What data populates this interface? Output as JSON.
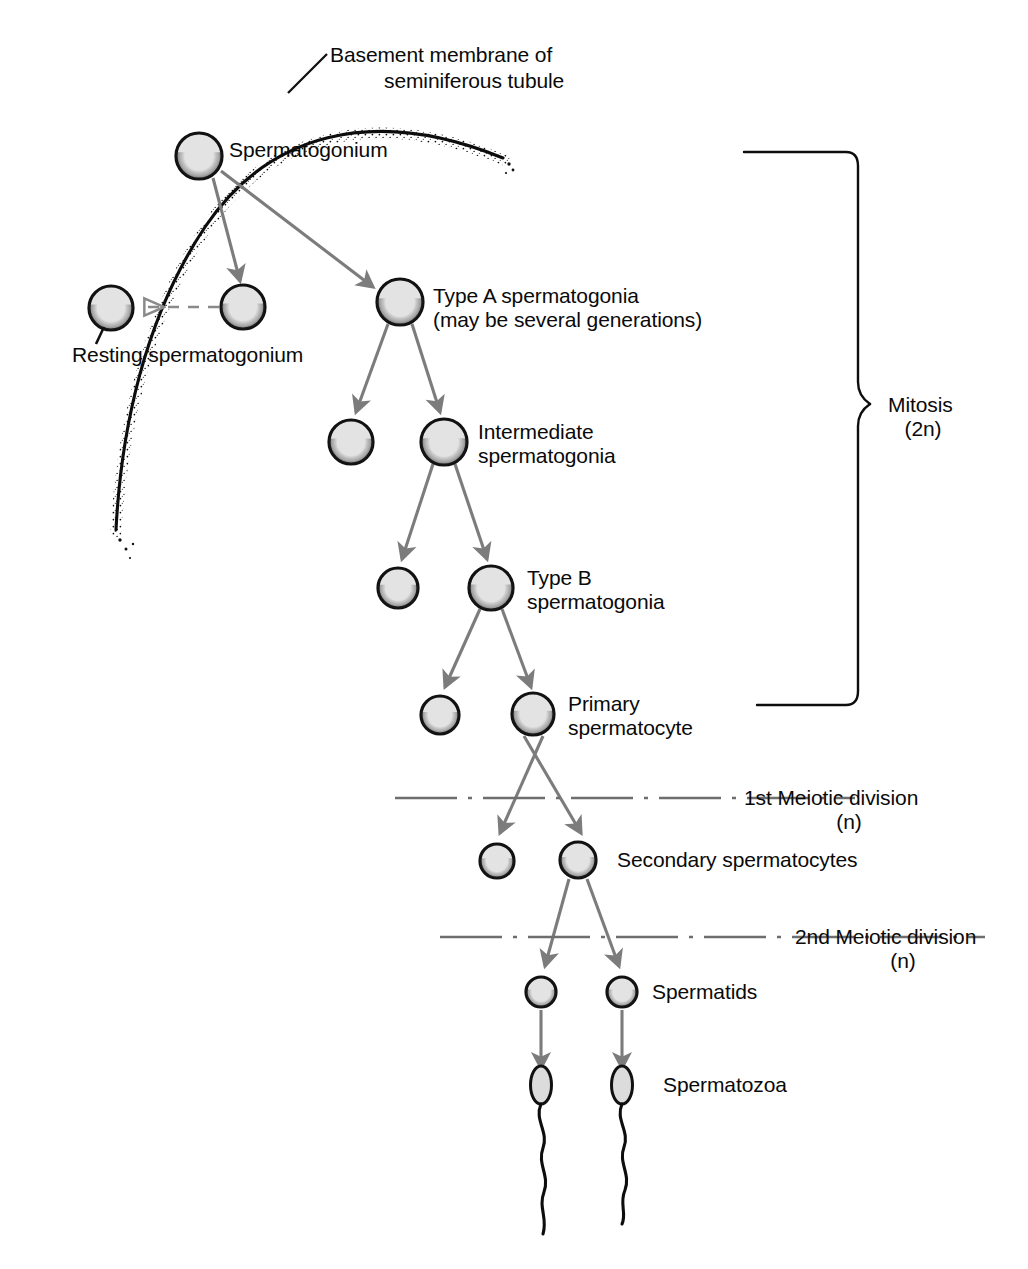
{
  "figure": {
    "background_color": "#ffffff",
    "ink_color": "#0a0a0a",
    "arrow_color": "#7c7c7c",
    "cell_fill_color": "#e3e3e3",
    "cell_outline_color": "#111111",
    "division_line_color": "#6e6e6e"
  },
  "labels": {
    "basement_membrane_line1": "Basement membrane of",
    "basement_membrane_line2": "seminiferous tubule",
    "spermatogonium": "Spermatogonium",
    "resting_spermatogonium": "Resting spermatogonium",
    "type_a_line1": "Type A spermatogonia",
    "type_a_line2": "(may be several generations)",
    "intermediate_line1": "Intermediate",
    "intermediate_line2": "spermatogonia",
    "type_b_line1": "Type B",
    "type_b_line2": "spermatogonia",
    "primary_line1": "Primary",
    "primary_line2": "spermatocyte",
    "first_meiotic_line1": "1st Meiotic division",
    "first_meiotic_line2": "(n)",
    "secondary_spermatocytes": "Secondary spermatocytes",
    "second_meiotic_line1": "2nd Meiotic division",
    "second_meiotic_line2": "(n)",
    "spermatids": "Spermatids",
    "spermatozoa": "Spermatozoa",
    "mitosis_line1": "Mitosis",
    "mitosis_line2": "(2n)"
  },
  "stages": [
    {
      "name": "spermatogonium",
      "label": "Spermatogonium",
      "ploidy": "2n",
      "cell_count": 1
    },
    {
      "name": "resting-spermatogonium",
      "label": "Resting spermatogonium",
      "ploidy": "2n",
      "cell_count": 1
    },
    {
      "name": "type-a-spermatogonia",
      "label": "Type A spermatogonia",
      "ploidy": "2n",
      "cell_count": 2
    },
    {
      "name": "intermediate-spermatogonia",
      "label": "Intermediate spermatogonia",
      "ploidy": "2n",
      "cell_count": 2
    },
    {
      "name": "type-b-spermatogonia",
      "label": "Type B spermatogonia",
      "ploidy": "2n",
      "cell_count": 2
    },
    {
      "name": "primary-spermatocyte",
      "label": "Primary spermatocyte",
      "ploidy": "2n",
      "cell_count": 2
    },
    {
      "name": "secondary-spermatocytes",
      "label": "Secondary spermatocytes",
      "ploidy": "n",
      "cell_count": 2
    },
    {
      "name": "spermatids",
      "label": "Spermatids",
      "ploidy": "n",
      "cell_count": 2
    },
    {
      "name": "spermatozoa",
      "label": "Spermatozoa",
      "ploidy": "n",
      "cell_count": 2
    }
  ],
  "brackets": [
    {
      "name": "mitosis-bracket",
      "label": "Mitosis",
      "sublabel": "(2n)",
      "spans": "spermatogonium through primary spermatocyte"
    }
  ],
  "division_lines": [
    {
      "name": "first-meiotic-division",
      "label": "1st Meiotic division",
      "sublabel": "(n)",
      "style": "dash-dot"
    },
    {
      "name": "second-meiotic-division",
      "label": "2nd Meiotic division",
      "sublabel": "(n)",
      "style": "dash-dot"
    }
  ]
}
